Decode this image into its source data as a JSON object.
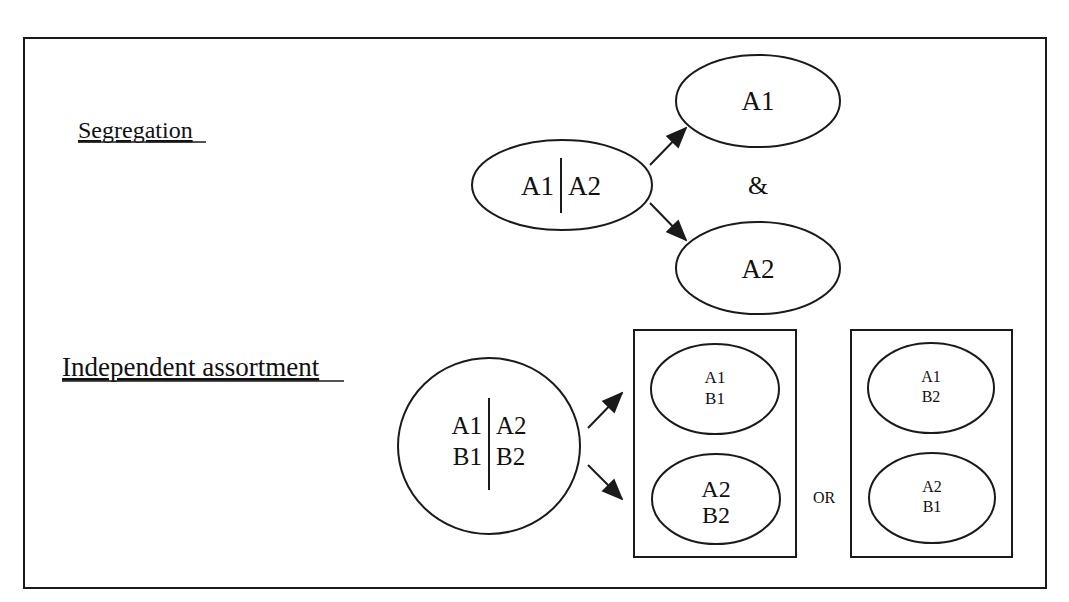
{
  "diagram": {
    "frame": {
      "border_color": "#1a1a1a",
      "background": "#ffffff"
    },
    "segregation": {
      "heading": "Segregation",
      "parent": {
        "left": "A1",
        "right": "A2"
      },
      "offspring": [
        {
          "label": "A1"
        },
        {
          "label": "A2"
        }
      ],
      "conjunction": "&"
    },
    "independent_assortment": {
      "heading": "Independent assortment",
      "parent": {
        "left_top": "A1",
        "right_top": "A2",
        "left_bottom": "B1",
        "right_bottom": "B2"
      },
      "option_groups": [
        {
          "gametes": [
            {
              "line1": "A1",
              "line2": "B1"
            },
            {
              "line1": "A2",
              "line2": "B2"
            }
          ]
        },
        {
          "gametes": [
            {
              "line1": "A1",
              "line2": "B2"
            },
            {
              "line1": "A2",
              "line2": "B1"
            }
          ]
        }
      ],
      "separator": "OR"
    }
  }
}
